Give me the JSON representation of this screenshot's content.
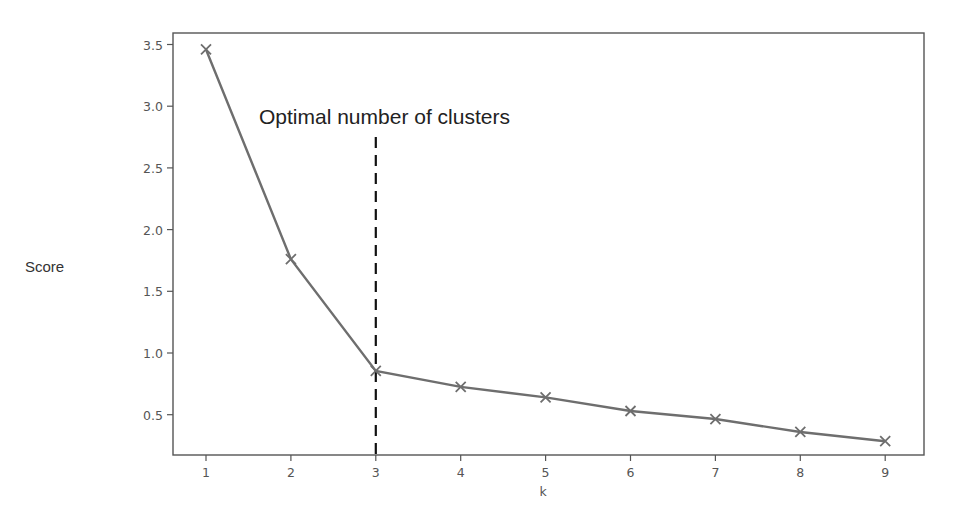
{
  "chart_data": {
    "type": "line",
    "title": "",
    "xlabel": "k",
    "ylabel": "Score",
    "x": [
      1,
      2,
      3,
      4,
      5,
      6,
      7,
      8,
      9
    ],
    "series": [
      {
        "name": "Score",
        "values": [
          3.46,
          1.76,
          0.855,
          0.725,
          0.64,
          0.53,
          0.465,
          0.36,
          0.285
        ],
        "marker": "x",
        "color": "#6e6e6e"
      }
    ],
    "xticks": [
      1,
      2,
      3,
      4,
      5,
      6,
      7,
      8,
      9
    ],
    "yticks": [
      0.5,
      1.0,
      1.5,
      2.0,
      2.5,
      3.0,
      3.5
    ],
    "xlim": [
      0.6,
      9.45
    ],
    "ylim": [
      0.17,
      3.58
    ],
    "grid": false,
    "legend": null,
    "annotations": [
      {
        "type": "text",
        "text": "Optimal number of clusters"
      },
      {
        "type": "vline",
        "x": 3,
        "style": "dashed",
        "color": "#111111"
      }
    ]
  },
  "labels": {
    "ylabel": "Score",
    "xlabel": "k",
    "annotation": "Optimal number of clusters"
  },
  "colors": {
    "line": "#6e6e6e",
    "frame": "#555555",
    "vline": "#111111"
  }
}
